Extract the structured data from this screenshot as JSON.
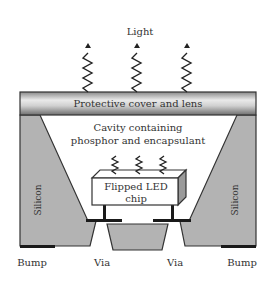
{
  "diagram": {
    "labels": {
      "light": "Light",
      "cover": "Protective cover and lens",
      "cavity_line1": "Cavity containing",
      "cavity_line2": "phosphor and encapsulant",
      "chip_line1": "Flipped LED",
      "chip_line2": "chip",
      "silicon_left": "Silicon",
      "silicon_right": "Silicon",
      "bump_left": "Bump",
      "via_left": "Via",
      "via_right": "Via",
      "bump_right": "Bump"
    },
    "colors": {
      "silicon": "#b3b3b3",
      "outline": "#333333",
      "contact": "#1a1a1a",
      "cover_light": "#e6e6e6",
      "cover_dark": "#7a7a7a"
    }
  }
}
